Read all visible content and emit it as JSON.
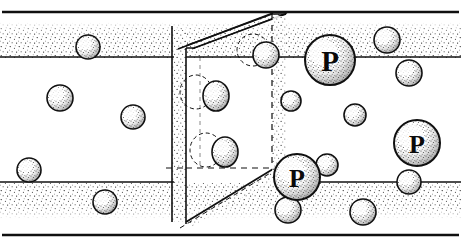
{
  "figure": {
    "description": "Perspective cut-away of a porous membrane slab separating two fluid regions. Small solvent spheres pass freely while large spheres labelled P are retained at the pore entrance.",
    "width": 461,
    "height": 247,
    "colors": {
      "ink": "#101010",
      "paper": "#ffffff",
      "stipple": "#1a1a1a",
      "sphere_fill": "#fbfbfb"
    }
  },
  "labels": {
    "large_particle": "P"
  },
  "frame": {
    "top_border": {
      "y": 12,
      "x1": 2,
      "x2": 459
    },
    "bottom_border": {
      "y": 235,
      "x1": 2,
      "x2": 459
    },
    "upper_interface": {
      "y": 57,
      "x1": 0,
      "x2": 461
    },
    "lower_interface": {
      "y": 182,
      "x1": 0,
      "x2": 461
    }
  },
  "bands": [
    {
      "name": "upper-stipple-band",
      "y_top": 22,
      "y_bottom": 57,
      "density": "medium"
    },
    {
      "name": "lower-stipple-band",
      "y_top": 182,
      "y_bottom": 219,
      "density": "medium"
    }
  ],
  "membrane": {
    "name": "membrane-slab",
    "front_face": {
      "x_left": 172,
      "x_right": 186,
      "y_top": 48,
      "y_bottom": 222
    },
    "top_edge": {
      "x1": 180,
      "y1": 48,
      "x2": 272,
      "y2": 14
    },
    "bottom_edge": {
      "x1": 186,
      "y1": 222,
      "x2": 277,
      "y2": 166
    },
    "pore": {
      "name": "membrane-pore",
      "front_x1": 186,
      "front_x2": 272,
      "front_y1": 57,
      "front_y2": 182,
      "back_x1": 200,
      "back_x2": 272,
      "back_y1": 57,
      "back_y2": 168
    }
  },
  "large_particles": [
    {
      "id": "P1",
      "label": "P",
      "cx": 330,
      "cy": 60,
      "r": 25,
      "region": "upper-right"
    },
    {
      "id": "P2",
      "label": "P",
      "cx": 297,
      "cy": 177,
      "r": 23,
      "region": "pore-exit"
    },
    {
      "id": "P3",
      "label": "P",
      "cx": 417,
      "cy": 143,
      "r": 23,
      "region": "lower-right"
    }
  ],
  "small_particles": [
    {
      "cx": 88,
      "cy": 47,
      "r": 12,
      "region": "upper-band-left"
    },
    {
      "cx": 60,
      "cy": 98,
      "r": 13,
      "region": "left-chamber"
    },
    {
      "cx": 133,
      "cy": 117,
      "r": 12,
      "region": "left-chamber"
    },
    {
      "cx": 29,
      "cy": 170,
      "r": 12,
      "region": "left-chamber"
    },
    {
      "cx": 105,
      "cy": 202,
      "r": 12,
      "region": "lower-band-left"
    },
    {
      "cx": 266,
      "cy": 55,
      "r": 13,
      "region": "pore-mouth-top"
    },
    {
      "cx": 216,
      "cy": 96,
      "r": 13,
      "region": "inside-pore",
      "shape": "ellipse",
      "rx": 13,
      "ry": 15
    },
    {
      "cx": 225,
      "cy": 152,
      "r": 13,
      "region": "inside-pore",
      "shape": "ellipse",
      "rx": 13,
      "ry": 15
    },
    {
      "cx": 291,
      "cy": 101,
      "r": 10,
      "region": "right-of-pore"
    },
    {
      "cx": 387,
      "cy": 40,
      "r": 13,
      "region": "upper-right"
    },
    {
      "cx": 409,
      "cy": 73,
      "r": 13,
      "region": "upper-right"
    },
    {
      "cx": 355,
      "cy": 115,
      "r": 11,
      "region": "mid-right"
    },
    {
      "cx": 327,
      "cy": 165,
      "r": 11,
      "region": "right-of-P2"
    },
    {
      "cx": 288,
      "cy": 210,
      "r": 13,
      "region": "lower-band"
    },
    {
      "cx": 363,
      "cy": 212,
      "r": 13,
      "region": "lower-band"
    },
    {
      "cx": 409,
      "cy": 182,
      "r": 12,
      "region": "below-P3"
    }
  ]
}
